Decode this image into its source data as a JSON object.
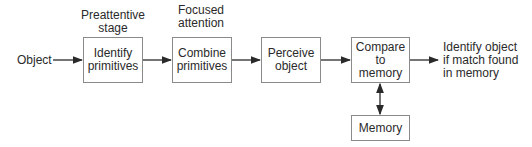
{
  "diagram": {
    "input_label": "Object",
    "stage_labels": [
      {
        "id": "preattentive",
        "text": "Preattentive\nstage"
      },
      {
        "id": "focused",
        "text": "Focused\nattention"
      }
    ],
    "nodes": [
      {
        "id": "identify",
        "text": "Identify\nprimitives"
      },
      {
        "id": "combine",
        "text": "Combine\nprimitives"
      },
      {
        "id": "perceive",
        "text": "Perceive\nobject"
      },
      {
        "id": "compare",
        "text": "Compare\nto\nmemory"
      },
      {
        "id": "memory",
        "text": "Memory"
      }
    ],
    "output_label": "Identify object\nif match found\nin memory",
    "edges": [
      {
        "from": "Object",
        "to": "identify",
        "type": "arrow"
      },
      {
        "from": "identify",
        "to": "combine",
        "type": "arrow"
      },
      {
        "from": "combine",
        "to": "perceive",
        "type": "arrow"
      },
      {
        "from": "perceive",
        "to": "compare",
        "type": "arrow"
      },
      {
        "from": "compare",
        "to": "output",
        "type": "arrow"
      },
      {
        "from": "compare",
        "to": "memory",
        "type": "bidirectional"
      }
    ],
    "colors": {
      "stroke": "#8a8a8a",
      "arrow": "#2a2a2a",
      "text": "#2a2a2a"
    }
  }
}
